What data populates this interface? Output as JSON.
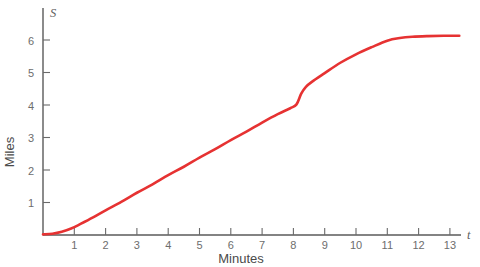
{
  "chart_data": {
    "type": "line",
    "title": "",
    "subtitle": "",
    "xlabel": "Minutes",
    "ylabel": "Miles",
    "x_axis_variable": "t",
    "y_axis_variable": "S",
    "grid": false,
    "legend": "none",
    "xlim": [
      0,
      13.8
    ],
    "ylim": [
      0,
      6.7
    ],
    "xticks": [
      1,
      2,
      3,
      4,
      5,
      6,
      7,
      8,
      9,
      10,
      11,
      12,
      13
    ],
    "xtick_labels": [
      "1",
      "2",
      "3",
      "4",
      "5",
      "6",
      "7",
      "8",
      "9",
      "10",
      "11",
      "12",
      "13"
    ],
    "yticks": [
      1,
      2,
      3,
      4,
      5,
      6
    ],
    "ytick_labels": [
      "1",
      "2",
      "3",
      "4",
      "5",
      "6"
    ],
    "series": [
      {
        "name": "Distance travelled",
        "color": "#e63232",
        "x": [
          0.0,
          0.3,
          0.6,
          0.9,
          1.2,
          1.6,
          2.0,
          2.5,
          3.0,
          3.5,
          4.0,
          4.5,
          5.0,
          5.5,
          6.0,
          6.5,
          7.0,
          7.5,
          7.9,
          8.1,
          8.25,
          8.4,
          8.6,
          9.0,
          9.5,
          10.0,
          10.5,
          11.0,
          11.4,
          11.8,
          12.3,
          12.8,
          13.3
        ],
        "y": [
          0.02,
          0.04,
          0.1,
          0.2,
          0.34,
          0.54,
          0.76,
          1.02,
          1.3,
          1.56,
          1.84,
          2.1,
          2.38,
          2.64,
          2.92,
          3.18,
          3.46,
          3.72,
          3.9,
          4.02,
          4.35,
          4.56,
          4.72,
          4.98,
          5.3,
          5.56,
          5.78,
          5.98,
          6.06,
          6.1,
          6.12,
          6.13,
          6.13
        ]
      }
    ],
    "annotations": [
      "curve starts flat at the origin then rises nearly linearly",
      "short steep step in the curve just after t = 8",
      "curve levels off near S = 6.1 after t = 11"
    ]
  },
  "colors": {
    "curve": "#e63232",
    "axis": "#5a5a5a",
    "tick_text": "#6d6d6d",
    "axis_title": "#4a4a4a",
    "background": "#ffffff"
  }
}
